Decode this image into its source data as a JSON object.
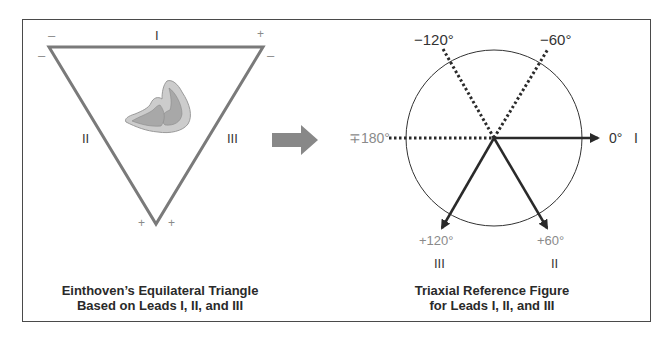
{
  "left_figure": {
    "caption_line1": "Einthoven’s Equilateral Triangle",
    "caption_line2": "Based on Leads I, II, and III",
    "lead_labels": {
      "I": "I",
      "II": "II",
      "III": "III"
    },
    "polarity": {
      "top_left_above": "–",
      "top_left_side": "–",
      "top_right_above": "+",
      "top_right_side": "–",
      "bottom_left": "+",
      "bottom_right": "+"
    }
  },
  "arrow": {
    "color": "#888888"
  },
  "right_figure": {
    "caption_line1": "Triaxial Reference Figure",
    "caption_line2": "for Leads I, II, and III",
    "angles": {
      "minus120": "−120°",
      "minus60": "−60°",
      "plusminus180": "∓180°",
      "zero": "0°",
      "plus120": "+120°",
      "plus60": "+60°"
    },
    "lead_labels": {
      "I": "I",
      "II": "II",
      "III": "III"
    }
  },
  "colors": {
    "triangle": "#7a7a7a",
    "heart_outer": "#c8c8c8",
    "heart_inner": "#a8a8a8",
    "vector": "#2a2a2a",
    "frame": "#4a4a4a"
  }
}
